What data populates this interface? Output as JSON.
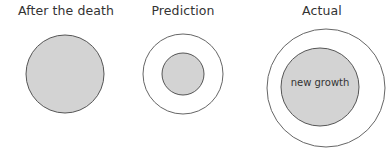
{
  "panels": [
    {
      "title": "After the death",
      "filled_circle": {
        "cx": 65,
        "cy": 74,
        "r": 39
      },
      "outline_circle": null,
      "inner_label": ""
    },
    {
      "title": "Prediction",
      "filled_circle": {
        "cx": 183,
        "cy": 74,
        "r": 21
      },
      "outline_circle": {
        "cx": 183,
        "cy": 74,
        "r": 40
      },
      "inner_label": ""
    },
    {
      "title": "Actual",
      "filled_circle": {
        "cx": 320,
        "cy": 87,
        "r": 39
      },
      "outline_circle": {
        "cx": 326,
        "cy": 88,
        "r": 59
      },
      "inner_label": "new growth"
    }
  ],
  "colors": {
    "fill": "#d3d3d3",
    "stroke": "#555555",
    "outline_stroke": "#666666",
    "text": "#333333"
  }
}
